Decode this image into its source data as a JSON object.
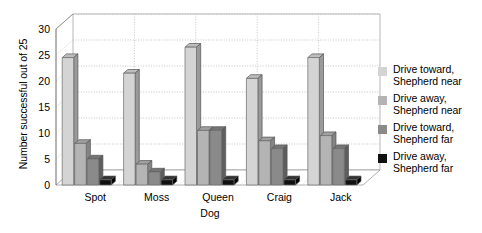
{
  "chart_data": {
    "type": "bar",
    "title": "",
    "xlabel": "Dog",
    "ylabel": "Number successful out of 25",
    "categories": [
      "Spot",
      "Moss",
      "Queen",
      "Craig",
      "Jack"
    ],
    "ylim": [
      0,
      30
    ],
    "yticks": [
      0,
      5,
      10,
      15,
      20,
      25,
      30
    ],
    "ytick_labels": [
      "0",
      "5",
      "10",
      "15",
      "20",
      "25",
      "30"
    ],
    "grid": "horizontal-dotted-and-vertical-dotted",
    "legend_position": "right",
    "style": "3d-clustered-column",
    "series": [
      {
        "name": "Drive toward,\nShepherd near",
        "color": "#d4d4d4",
        "side_color": "#9a9a9a",
        "top_color": "#bdbdbd",
        "values": [
          24.5,
          21.5,
          26.5,
          20.5,
          24.5
        ]
      },
      {
        "name": "Drive away,\nShepherd near",
        "color": "#b4b4b4",
        "side_color": "#848484",
        "top_color": "#a0a0a0",
        "values": [
          8.0,
          4.0,
          10.5,
          8.5,
          9.5
        ]
      },
      {
        "name": "Drive toward,\nShepherd far",
        "color": "#8a8a8a",
        "side_color": "#5e5e5e",
        "top_color": "#757575",
        "values": [
          5.0,
          2.5,
          10.5,
          7.0,
          7.0
        ]
      },
      {
        "name": "Drive away,\nShepherd far",
        "color": "#111111",
        "side_color": "#000000",
        "top_color": "#333333",
        "values": [
          1.0,
          1.0,
          1.0,
          1.0,
          1.0
        ]
      }
    ]
  },
  "legend": {
    "items": [
      {
        "label": "Drive toward,\nShepherd near",
        "color": "#d4d4d4"
      },
      {
        "label": "Drive away,\nShepherd near",
        "color": "#b4b4b4"
      },
      {
        "label": "Drive toward,\nShepherd far",
        "color": "#8a8a8a"
      },
      {
        "label": "Drive away,\nShepherd far",
        "color": "#111111"
      }
    ]
  }
}
